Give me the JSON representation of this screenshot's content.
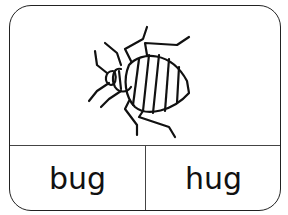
{
  "card": {
    "picture": "bedbug-icon",
    "words": [
      {
        "label": "bug"
      },
      {
        "label": "hug"
      }
    ]
  }
}
